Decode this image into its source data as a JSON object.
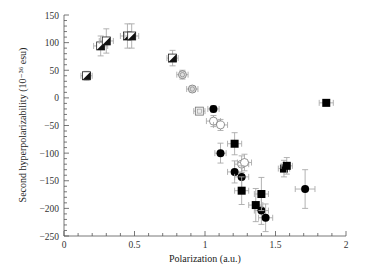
{
  "chart_data": {
    "type": "scatter",
    "title": "",
    "xlabel": "Polarization (a.u.)",
    "ylabel": "Second hyperpolarizability (10⁻³⁶ esu)",
    "xlim": [
      0,
      2
    ],
    "ylim": [
      -250,
      150
    ],
    "x_ticks": [
      0,
      0.5,
      1,
      1.5,
      2
    ],
    "x_tick_labels": [
      "0",
      "0.5",
      "1",
      "1.5",
      "2"
    ],
    "y_ticks": [
      -250,
      -200,
      -150,
      -100,
      -50,
      0,
      50,
      100,
      150
    ],
    "y_tick_labels": [
      "−250",
      "−200",
      "−150",
      "−100",
      "−50",
      "0",
      "50",
      "100",
      "150"
    ],
    "grid": false,
    "legend": null,
    "series": [
      {
        "name": "half-filled squares",
        "marker": "half-square",
        "points": [
          {
            "x": 0.16,
            "y": 40,
            "xerr": 0.04,
            "yerr": 8
          },
          {
            "x": 0.26,
            "y": 94,
            "xerr": 0.05,
            "yerr": 18
          },
          {
            "x": 0.3,
            "y": 103,
            "xerr": 0.05,
            "yerr": 22
          },
          {
            "x": 0.45,
            "y": 112,
            "xerr": 0.05,
            "yerr": 22
          },
          {
            "x": 0.48,
            "y": 112,
            "xerr": 0.05,
            "yerr": 22
          },
          {
            "x": 0.77,
            "y": 72,
            "xerr": 0.04,
            "yerr": 14
          }
        ]
      },
      {
        "name": "gray circles",
        "marker": "gray-circle",
        "points": [
          {
            "x": 0.84,
            "y": 42,
            "xerr": 0.04,
            "yerr": 8
          },
          {
            "x": 0.91,
            "y": 16,
            "xerr": 0.04,
            "yerr": 5
          }
        ]
      },
      {
        "name": "open squares",
        "marker": "open-square",
        "points": [
          {
            "x": 0.96,
            "y": -24,
            "xerr": 0.04,
            "yerr": 6
          }
        ]
      },
      {
        "name": "open circles",
        "marker": "open-circle",
        "points": [
          {
            "x": 1.06,
            "y": -42,
            "xerr": 0.05,
            "yerr": 10
          },
          {
            "x": 1.11,
            "y": -49,
            "xerr": 0.05,
            "yerr": 10
          },
          {
            "x": 1.26,
            "y": -120,
            "xerr": 0.05,
            "yerr": 15
          },
          {
            "x": 1.28,
            "y": -117,
            "xerr": 0.05,
            "yerr": 15
          }
        ]
      },
      {
        "name": "filled circles",
        "marker": "filled-circle",
        "points": [
          {
            "x": 1.06,
            "y": -20,
            "xerr": 0.04,
            "yerr": 6
          },
          {
            "x": 1.11,
            "y": -100,
            "xerr": 0.04,
            "yerr": 18
          },
          {
            "x": 1.21,
            "y": -134,
            "xerr": 0.05,
            "yerr": 20
          },
          {
            "x": 1.26,
            "y": -143,
            "xerr": 0.05,
            "yerr": 20
          },
          {
            "x": 1.4,
            "y": -204,
            "xerr": 0.05,
            "yerr": 25
          },
          {
            "x": 1.43,
            "y": -217,
            "xerr": 0.05,
            "yerr": 25
          },
          {
            "x": 1.71,
            "y": -165,
            "xerr": 0.07,
            "yerr": 35
          }
        ]
      },
      {
        "name": "filled squares",
        "marker": "filled-square",
        "points": [
          {
            "x": 1.21,
            "y": -83,
            "xerr": 0.05,
            "yerr": 20
          },
          {
            "x": 1.26,
            "y": -168,
            "xerr": 0.05,
            "yerr": 25
          },
          {
            "x": 1.4,
            "y": -174,
            "xerr": 0.05,
            "yerr": 30
          },
          {
            "x": 1.36,
            "y": -194,
            "xerr": 0.05,
            "yerr": 30
          },
          {
            "x": 1.56,
            "y": -128,
            "xerr": 0.04,
            "yerr": 15
          },
          {
            "x": 1.58,
            "y": -123,
            "xerr": 0.04,
            "yerr": 15
          },
          {
            "x": 1.86,
            "y": -9,
            "xerr": 0.05,
            "yerr": 5
          }
        ]
      }
    ]
  }
}
